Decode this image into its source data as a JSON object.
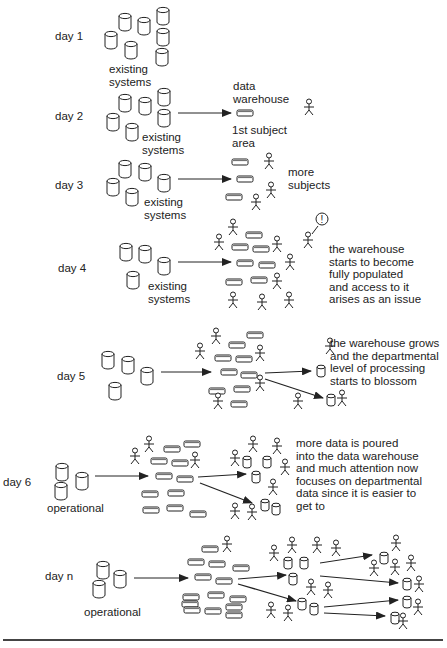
{
  "stages": [
    {
      "id": "day1",
      "label": "day 1",
      "source_label": "existing\nsystems",
      "note": ""
    },
    {
      "id": "day2",
      "label": "day 2",
      "source_label": "existing\nsystems",
      "target_top_label": "data\nwarehouse",
      "target_bottom_label": "1st subject\narea",
      "note": ""
    },
    {
      "id": "day3",
      "label": "day 3",
      "source_label": "existing\nsystems",
      "note": "more\nsubjects"
    },
    {
      "id": "day4",
      "label": "day 4",
      "source_label": "existing\nsystems",
      "note": "the warehouse\nstarts to become\nfully populated\nand access to it\narises as an issue",
      "callout": "!"
    },
    {
      "id": "day5",
      "label": "day 5",
      "source_label": "",
      "note": "the warehouse grows\nand the departmental\nlevel of processing\nstarts to blossom"
    },
    {
      "id": "day6",
      "label": "day 6",
      "source_label": "operational",
      "note": "more data is poured\ninto the data warehouse\nand much attention now\nfocuses on departmental\ndata since it is easier to\nget to"
    },
    {
      "id": "dayn",
      "label": "day n",
      "source_label": "operational",
      "note": ""
    }
  ],
  "icons": {
    "source_system": "cylinder-database-icon",
    "warehouse_table": "flat-disk-icon",
    "user": "stick-figure-icon",
    "flow": "arrow-icon"
  },
  "colors": {
    "stroke": "#222222",
    "background": "#ffffff",
    "rule": "#444444"
  }
}
